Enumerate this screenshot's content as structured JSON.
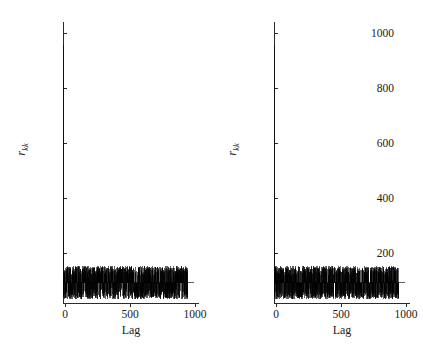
{
  "figure": {
    "background": "#ffffff",
    "line_color": "#000000",
    "axis_color": "#2b2b2b"
  },
  "panels": [
    {
      "id": "left-panel",
      "ylabel_main": "r",
      "ylabel_sub": "kk",
      "xlabel": "Lag"
    },
    {
      "id": "right-panel",
      "ylabel_main": "r",
      "ylabel_sub": "kk",
      "xlabel": "Lag"
    }
  ],
  "yticks": [
    "1000",
    "800",
    "600",
    "400",
    "200",
    "0"
  ],
  "xticks": [
    "0",
    "500",
    "1000"
  ],
  "chart_data": [
    {
      "type": "line",
      "subtype": "stem-autocorrelation",
      "title": "",
      "xlabel": "Lag",
      "ylabel": "r_kk",
      "xlim": [
        0,
        1050
      ],
      "ylim": [
        -90,
        1080
      ],
      "xticks": [
        0,
        500,
        1000
      ],
      "yticks": [
        0,
        200,
        400,
        600,
        800,
        1000
      ],
      "grid": false,
      "legend": null,
      "panel": "left",
      "description": "Stem plot of autocorrelation r_kk versus Lag. A single tall spike at lag 0 rises to about 1000. All remaining lags form a dense band of positive and negative spikes oscillating between roughly -70 and +70 about zero.",
      "lag0_value": 1000,
      "noise_band": [
        -70,
        70
      ],
      "n_lags": 1000,
      "seed": 17,
      "x": [
        0,
        500,
        1000
      ],
      "values": [
        1000,
        0,
        0
      ]
    },
    {
      "type": "line",
      "subtype": "stem-autocorrelation",
      "title": "",
      "xlabel": "Lag",
      "ylabel": "r_kk",
      "xlim": [
        0,
        1050
      ],
      "ylim": [
        -90,
        1080
      ],
      "xticks": [
        0,
        500,
        1000
      ],
      "yticks": [
        0,
        200,
        400,
        600,
        800,
        1000
      ],
      "grid": false,
      "legend": null,
      "panel": "right",
      "description": "Stem plot of autocorrelation r_kk versus Lag. A single tall spike at lag 0 rises to about 1000. All remaining lags form a dense band of positive and negative spikes oscillating between roughly -70 and +70 about zero.",
      "lag0_value": 1000,
      "noise_band": [
        -70,
        70
      ],
      "n_lags": 1000,
      "seed": 93,
      "x": [
        0,
        500,
        1000
      ],
      "values": [
        1000,
        0,
        0
      ]
    }
  ]
}
